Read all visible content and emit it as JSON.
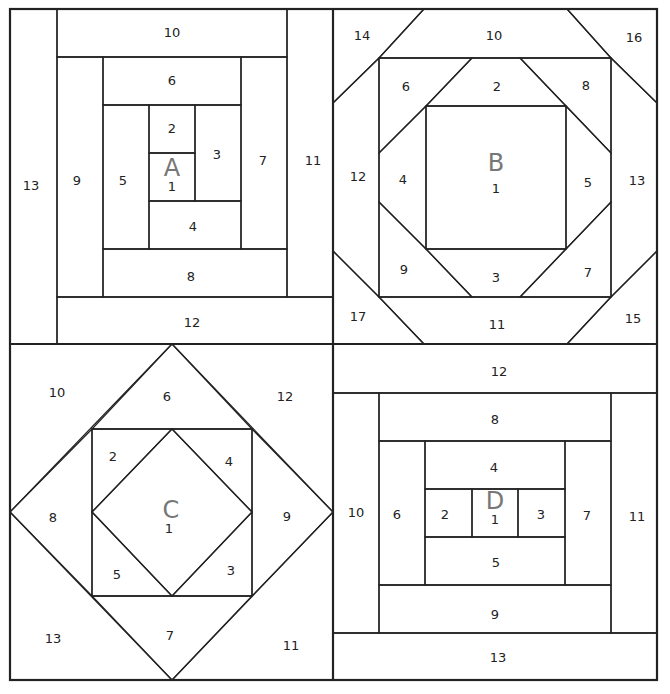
{
  "colors": {
    "shaded": "#e2e2e2",
    "light": "#f6f6f6",
    "white": "#ffffff",
    "line": "#222222",
    "label": "#777777"
  },
  "blocks": [
    {
      "id": "A",
      "letter": "A",
      "pattern": "log-cabin-spiral",
      "pieces": [
        {
          "n": "1",
          "shade": "white"
        },
        {
          "n": "2",
          "shade": "light"
        },
        {
          "n": "3",
          "shade": "light"
        },
        {
          "n": "4",
          "shade": "shaded"
        },
        {
          "n": "5",
          "shade": "shaded"
        },
        {
          "n": "6",
          "shade": "light"
        },
        {
          "n": "7",
          "shade": "light"
        },
        {
          "n": "8",
          "shade": "shaded"
        },
        {
          "n": "9",
          "shade": "shaded"
        },
        {
          "n": "10",
          "shade": "light"
        },
        {
          "n": "11",
          "shade": "light"
        },
        {
          "n": "12",
          "shade": "shaded"
        },
        {
          "n": "13",
          "shade": "shaded"
        }
      ]
    },
    {
      "id": "B",
      "letter": "B",
      "pattern": "square-in-octagon",
      "pieces": [
        {
          "n": "1",
          "shade": "light"
        },
        {
          "n": "2",
          "shade": "white"
        },
        {
          "n": "3",
          "shade": "white"
        },
        {
          "n": "4",
          "shade": "white"
        },
        {
          "n": "5",
          "shade": "white"
        },
        {
          "n": "6",
          "shade": "shaded"
        },
        {
          "n": "7",
          "shade": "shaded"
        },
        {
          "n": "8",
          "shade": "shaded"
        },
        {
          "n": "9",
          "shade": "shaded"
        },
        {
          "n": "10",
          "shade": "white"
        },
        {
          "n": "11",
          "shade": "white"
        },
        {
          "n": "12",
          "shade": "white"
        },
        {
          "n": "13",
          "shade": "white"
        },
        {
          "n": "14",
          "shade": "shaded"
        },
        {
          "n": "15",
          "shade": "shaded"
        },
        {
          "n": "16",
          "shade": "shaded"
        },
        {
          "n": "17",
          "shade": "shaded"
        }
      ]
    },
    {
      "id": "C",
      "letter": "C",
      "pattern": "square-in-square",
      "pieces": [
        {
          "n": "1",
          "shade": "white"
        },
        {
          "n": "2",
          "shade": "white"
        },
        {
          "n": "3",
          "shade": "white"
        },
        {
          "n": "4",
          "shade": "white"
        },
        {
          "n": "5",
          "shade": "white"
        },
        {
          "n": "6",
          "shade": "shaded"
        },
        {
          "n": "7",
          "shade": "shaded"
        },
        {
          "n": "8",
          "shade": "shaded"
        },
        {
          "n": "9",
          "shade": "shaded"
        },
        {
          "n": "10",
          "shade": "white"
        },
        {
          "n": "11",
          "shade": "white"
        },
        {
          "n": "12",
          "shade": "white"
        },
        {
          "n": "13",
          "shade": "white"
        }
      ]
    },
    {
      "id": "D",
      "letter": "D",
      "pattern": "courthouse-steps",
      "pieces": [
        {
          "n": "1",
          "shade": "white"
        },
        {
          "n": "2",
          "shade": "white"
        },
        {
          "n": "3",
          "shade": "white"
        },
        {
          "n": "4",
          "shade": "shaded"
        },
        {
          "n": "5",
          "shade": "shaded"
        },
        {
          "n": "6",
          "shade": "white"
        },
        {
          "n": "7",
          "shade": "white"
        },
        {
          "n": "8",
          "shade": "shaded"
        },
        {
          "n": "9",
          "shade": "shaded"
        },
        {
          "n": "10",
          "shade": "white"
        },
        {
          "n": "11",
          "shade": "white"
        },
        {
          "n": "12",
          "shade": "shaded"
        },
        {
          "n": "13",
          "shade": "shaded"
        }
      ]
    }
  ]
}
